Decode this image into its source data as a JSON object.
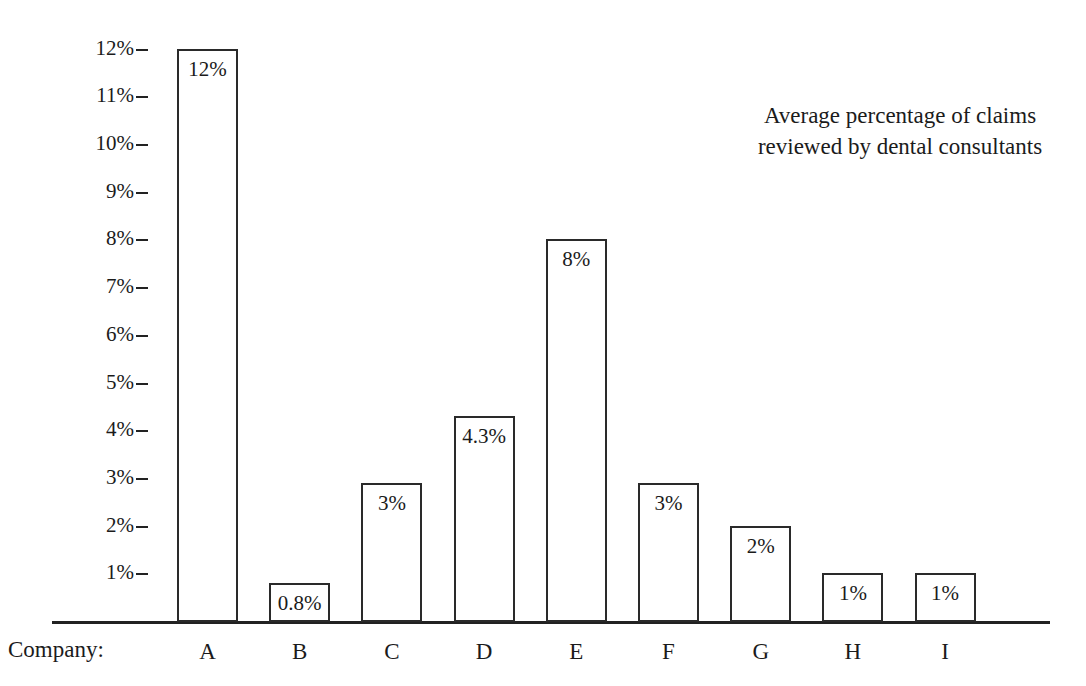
{
  "chart_data": {
    "type": "bar",
    "title": "",
    "annotation": "Average percentage of claims reviewed by dental consultants",
    "annotation_line1": "Average percentage of claims",
    "annotation_line2": "reviewed by dental consultants",
    "xlabel": "Company:",
    "ylabel": "",
    "categories": [
      "A",
      "B",
      "C",
      "D",
      "E",
      "F",
      "G",
      "H",
      "I"
    ],
    "values": [
      12,
      0.8,
      2.9,
      4.3,
      8,
      2.9,
      2,
      1,
      1
    ],
    "value_labels": [
      "12%",
      "0.8%",
      "3%",
      "4.3%",
      "8%",
      "3%",
      "2%",
      "1%",
      "1%"
    ],
    "ylim": [
      0,
      12
    ],
    "ytick_values": [
      1,
      2,
      3,
      4,
      5,
      6,
      7,
      8,
      9,
      10,
      11,
      12
    ],
    "ytick_labels": [
      "1%",
      "2%",
      "3%",
      "4%",
      "5%",
      "6%",
      "7%",
      "8%",
      "9%",
      "10%",
      "11%",
      "12%"
    ],
    "grid": false,
    "legend": "none",
    "bar_fill_color": "#ffffff",
    "bar_edge_color": "#2a2a2a",
    "axis_color": "#222222",
    "text_color": "#1b1b1b",
    "background_color": "#ffffff"
  }
}
